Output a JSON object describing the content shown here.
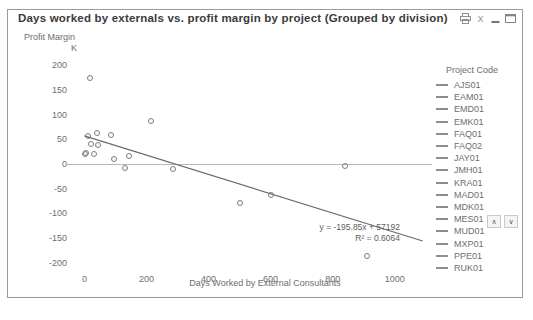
{
  "window": {
    "title": "Days worked by externals vs. profit margin by project (Grouped by division)",
    "buttons": [
      {
        "name": "print-icon",
        "label": "Print"
      },
      {
        "name": "export-icon",
        "label": "Export"
      },
      {
        "name": "minimize-icon",
        "label": "Minimize"
      },
      {
        "name": "maximize-icon",
        "label": "Maximize"
      }
    ]
  },
  "legend": {
    "title": "Project Code",
    "scroll_up": "∧",
    "scroll_down": "∨",
    "items": [
      {
        "label": "AJS01",
        "color": "#8d8d8d"
      },
      {
        "label": "EAM01",
        "color": "#8d8d8d"
      },
      {
        "label": "EMD01",
        "color": "#8d8d8d"
      },
      {
        "label": "EMK01",
        "color": "#8d8d8d"
      },
      {
        "label": "FAQ01",
        "color": "#8d8d8d"
      },
      {
        "label": "FAQ02",
        "color": "#8d8d8d"
      },
      {
        "label": "JAY01",
        "color": "#8d8d8d"
      },
      {
        "label": "JMH01",
        "color": "#8d8d8d"
      },
      {
        "label": "KRA01",
        "color": "#8d8d8d"
      },
      {
        "label": "MAD01",
        "color": "#8d8d8d"
      },
      {
        "label": "MDK01",
        "color": "#8d8d8d"
      },
      {
        "label": "MES01",
        "color": "#8d8d8d"
      },
      {
        "label": "MUD01",
        "color": "#8d8d8d"
      },
      {
        "label": "MXP01",
        "color": "#8d8d8d"
      },
      {
        "label": "PPE01",
        "color": "#8d8d8d"
      },
      {
        "label": "RUK01",
        "color": "#8d8d8d"
      }
    ]
  },
  "chart_data": {
    "type": "scatter",
    "title": "Days worked by externals vs. profit margin by project (Grouped by division)",
    "xlabel": "Days Worked by External Consultants",
    "ylabel": "Profit Margin",
    "yunit": "K",
    "xlim": [
      -40,
      1120
    ],
    "ylim": [
      -215,
      215
    ],
    "xticks": [
      0,
      200,
      400,
      600,
      800,
      1000
    ],
    "yticks": [
      200,
      150,
      100,
      50,
      0,
      -50,
      -100,
      -150,
      -200
    ],
    "grid": false,
    "zero_line": true,
    "legend_position": "right",
    "marker": "open-circle",
    "marker_color": "#7d7d7d",
    "points": [
      {
        "x": 2,
        "y": 20
      },
      {
        "x": 5,
        "y": 22
      },
      {
        "x": 10,
        "y": 57
      },
      {
        "x": 20,
        "y": 40
      },
      {
        "x": 17,
        "y": 175
      },
      {
        "x": 30,
        "y": 20
      },
      {
        "x": 40,
        "y": 62
      },
      {
        "x": 45,
        "y": 38
      },
      {
        "x": 85,
        "y": 59
      },
      {
        "x": 95,
        "y": 10
      },
      {
        "x": 130,
        "y": -9
      },
      {
        "x": 145,
        "y": 16
      },
      {
        "x": 215,
        "y": 87
      },
      {
        "x": 285,
        "y": -11
      },
      {
        "x": 500,
        "y": -80
      },
      {
        "x": 600,
        "y": -62
      },
      {
        "x": 840,
        "y": -5
      },
      {
        "x": 910,
        "y": -187
      }
    ],
    "trendline": {
      "slope": -195.85,
      "intercept": 57192,
      "equation": "y = -195.85x + 57192",
      "r_squared_label": "R² = 0.6064",
      "r_squared": 0.6064,
      "color": "#6b6b6b"
    }
  }
}
